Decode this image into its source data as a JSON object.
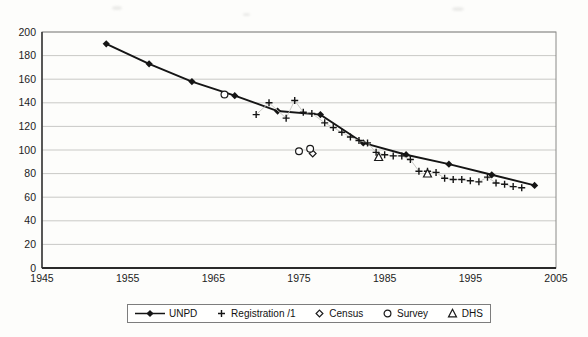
{
  "chart_data": {
    "type": "line",
    "title": "",
    "xlabel": "",
    "ylabel": "",
    "xlim": [
      1945,
      2005
    ],
    "ylim": [
      0,
      200
    ],
    "x_ticks": [
      1945,
      1955,
      1965,
      1975,
      1985,
      1995,
      2005
    ],
    "y_ticks": [
      0,
      20,
      40,
      60,
      80,
      100,
      120,
      140,
      160,
      180,
      200
    ],
    "grid": "horizontal",
    "legend_position": "bottom",
    "series": [
      {
        "name": "UNPD",
        "type": "line",
        "marker": "filled-diamond",
        "color": "#151515",
        "points": [
          [
            1952.5,
            190
          ],
          [
            1957.5,
            173
          ],
          [
            1962.5,
            158
          ],
          [
            1967.5,
            146
          ],
          [
            1972.5,
            133
          ],
          [
            1977.5,
            130
          ],
          [
            1982.5,
            106
          ],
          [
            1987.5,
            96
          ],
          [
            1992.5,
            88
          ],
          [
            1997.5,
            79
          ],
          [
            2002.5,
            70
          ]
        ]
      },
      {
        "name": "Registration /1",
        "type": "scatter",
        "marker": "plus",
        "color": "#151515",
        "connector": "#c4c4c0",
        "points": [
          [
            1970,
            130
          ],
          [
            1971.5,
            140
          ],
          [
            1973.5,
            127
          ],
          [
            1974.5,
            142
          ],
          [
            1975.5,
            132
          ],
          [
            1976.5,
            131
          ],
          [
            1978,
            123
          ],
          [
            1979,
            119
          ],
          [
            1980,
            115
          ],
          [
            1981,
            111
          ],
          [
            1982,
            108
          ],
          [
            1983,
            106
          ],
          [
            1984,
            98
          ],
          [
            1985,
            96
          ],
          [
            1986,
            95
          ],
          [
            1987,
            95
          ],
          [
            1988,
            92
          ],
          [
            1989,
            82
          ],
          [
            1990,
            82
          ],
          [
            1991,
            81
          ],
          [
            1992,
            76
          ],
          [
            1993,
            75
          ],
          [
            1994,
            75
          ],
          [
            1995,
            74
          ],
          [
            1996,
            73
          ],
          [
            1997,
            77
          ],
          [
            1998,
            72
          ],
          [
            1999,
            71
          ],
          [
            2000,
            69
          ],
          [
            2001,
            68
          ]
        ]
      },
      {
        "name": "Census",
        "type": "scatter",
        "marker": "open-diamond",
        "color": "#1a1a1a",
        "points": [
          [
            1976.6,
            97
          ]
        ]
      },
      {
        "name": "Survey",
        "type": "scatter",
        "marker": "open-circle",
        "color": "#1a1a1a",
        "points": [
          [
            1966.3,
            147
          ],
          [
            1975,
            99
          ],
          [
            1976.3,
            101
          ]
        ]
      },
      {
        "name": "DHS",
        "type": "scatter",
        "marker": "open-triangle",
        "color": "#1a1a1a",
        "points": [
          [
            1984.3,
            94
          ],
          [
            1990,
            80
          ]
        ]
      }
    ],
    "colors": {
      "grid": "#c9c9c6",
      "plot_border": "#8a8a88",
      "axis": "#2a2a2a",
      "text": "#1c1c1c"
    }
  }
}
